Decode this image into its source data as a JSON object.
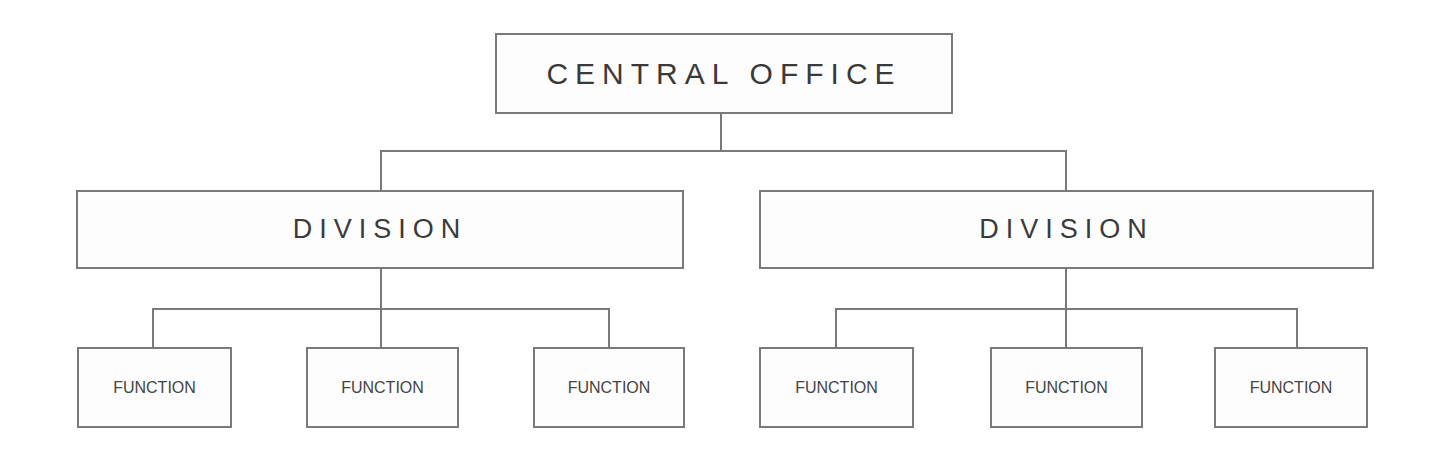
{
  "diagram": {
    "type": "org-chart",
    "root": {
      "label": "CENTRAL OFFICE"
    },
    "divisions": [
      {
        "label": "DIVISION",
        "functions": [
          {
            "label": "FUNCTION"
          },
          {
            "label": "FUNCTION"
          },
          {
            "label": "FUNCTION"
          }
        ]
      },
      {
        "label": "DIVISION",
        "functions": [
          {
            "label": "FUNCTION"
          },
          {
            "label": "FUNCTION"
          },
          {
            "label": "FUNCTION"
          }
        ]
      }
    ]
  },
  "colors": {
    "line": "#7a7a7a",
    "text": "#3a3a3a",
    "background": "#ffffff"
  }
}
